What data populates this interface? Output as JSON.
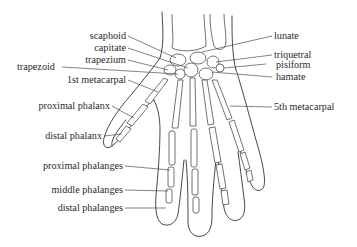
{
  "diagram": {
    "colors": {
      "background": "#ffffff",
      "line": "#333333",
      "text": "#2a2a2a"
    },
    "labels_left": [
      {
        "id": "scaphoid",
        "text": "scaphoid"
      },
      {
        "id": "capitate",
        "text": "capitate"
      },
      {
        "id": "trapezium",
        "text": "trapezium"
      },
      {
        "id": "trapezoid",
        "text": "trapezoid"
      },
      {
        "id": "first-metacarpal",
        "text": "1st metacarpal"
      },
      {
        "id": "proximal-phalanx",
        "text": "proximal phalanx"
      },
      {
        "id": "distal-phalanx",
        "text": "distal phalanx"
      },
      {
        "id": "proximal-phalanges",
        "text": "proximal phalanges"
      },
      {
        "id": "middle-phalanges",
        "text": "middle phalanges"
      },
      {
        "id": "distal-phalanges",
        "text": "distal phalanges"
      }
    ],
    "labels_right": [
      {
        "id": "lunate",
        "text": "lunate"
      },
      {
        "id": "triquetral",
        "text": "triquetral"
      },
      {
        "id": "pisiform",
        "text": "pisiform"
      },
      {
        "id": "hamate",
        "text": "hamate"
      },
      {
        "id": "fifth-metacarpal",
        "text": "5th metacarpal"
      }
    ]
  }
}
